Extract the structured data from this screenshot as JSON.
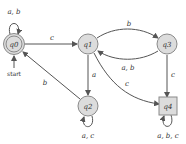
{
  "diagram": {
    "type": "finite-automaton",
    "colors": {
      "node_fill": "#dcdcdc",
      "node_stroke": "#8a8a8a",
      "edge": "#555555",
      "text": "#333333"
    },
    "start_label": "start",
    "states": [
      {
        "id": "q0",
        "label": "q0",
        "accepting": true,
        "start": true,
        "shape": "double-circle"
      },
      {
        "id": "q1",
        "label": "q1",
        "shape": "circle"
      },
      {
        "id": "q2",
        "label": "q2",
        "shape": "circle"
      },
      {
        "id": "q3",
        "label": "q3",
        "shape": "circle"
      },
      {
        "id": "q4",
        "label": "q4",
        "shape": "square"
      }
    ],
    "transitions": [
      {
        "from": "q0",
        "to": "q0",
        "label": "a, b"
      },
      {
        "from": "q0",
        "to": "q1",
        "label": "c"
      },
      {
        "from": "q1",
        "to": "q3",
        "label": "b"
      },
      {
        "from": "q3",
        "to": "q1",
        "label": "a, b"
      },
      {
        "from": "q1",
        "to": "q2",
        "label": "a"
      },
      {
        "from": "q2",
        "to": "q0",
        "label": "b"
      },
      {
        "from": "q1",
        "to": "q4",
        "label": "c"
      },
      {
        "from": "q3",
        "to": "q4",
        "label": "c"
      },
      {
        "from": "q2",
        "to": "q2",
        "label": "a, c"
      },
      {
        "from": "q4",
        "to": "q4",
        "label": "a, b, c"
      }
    ]
  }
}
